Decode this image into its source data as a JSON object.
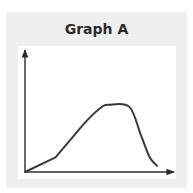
{
  "chart_data": {
    "type": "line",
    "title": "Graph A",
    "xlabel": "",
    "ylabel": "",
    "grid": false,
    "legend": null,
    "x_ticks": [],
    "y_ticks": [],
    "series": [
      {
        "name": "curve",
        "color": "#3a3a3a",
        "description": "Unlabeled qualitative curve: gradual rise, steeper rise to a peak plateau, then a steep fall",
        "points_relative": [
          {
            "x": 0.0,
            "y": 0.0
          },
          {
            "x": 0.21,
            "y": 0.14
          },
          {
            "x": 0.4,
            "y": 0.45
          },
          {
            "x": 0.52,
            "y": 0.61
          },
          {
            "x": 0.58,
            "y": 0.64
          },
          {
            "x": 0.72,
            "y": 0.62
          },
          {
            "x": 0.8,
            "y": 0.35
          },
          {
            "x": 0.86,
            "y": 0.14
          },
          {
            "x": 0.91,
            "y": 0.06
          }
        ]
      }
    ]
  },
  "colors": {
    "panel_background": "#efefef",
    "plot_background": "#ffffff",
    "axis": "#2b2b2b",
    "line": "#3a3a3a",
    "title": "#2b2b2b"
  }
}
